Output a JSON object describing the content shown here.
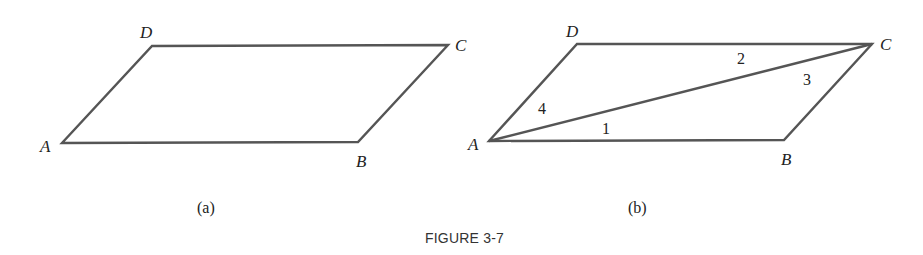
{
  "figure": {
    "caption": "FIGURE 3-7",
    "line_color": "#555555",
    "text_color": "#222222"
  },
  "panel_a": {
    "sublabel": "(a)",
    "vertices": {
      "A": {
        "label": "A",
        "x": 62,
        "y": 143
      },
      "B": {
        "label": "B",
        "x": 358,
        "y": 142
      },
      "C": {
        "label": "C",
        "x": 448,
        "y": 45
      },
      "D": {
        "label": "D",
        "x": 152,
        "y": 46
      }
    },
    "edges": [
      "AB",
      "BC",
      "CD",
      "DA"
    ]
  },
  "panel_b": {
    "sublabel": "(b)",
    "vertices": {
      "A": {
        "label": "A",
        "x": 489,
        "y": 141
      },
      "B": {
        "label": "B",
        "x": 784,
        "y": 140
      },
      "C": {
        "label": "C",
        "x": 872,
        "y": 44
      },
      "D": {
        "label": "D",
        "x": 577,
        "y": 44
      }
    },
    "edges": [
      "AB",
      "BC",
      "CD",
      "DA",
      "AC"
    ],
    "diagonal": "AC",
    "angles": [
      {
        "label": "1",
        "x": 602,
        "y": 134
      },
      {
        "label": "2",
        "x": 741,
        "y": 64
      },
      {
        "label": "3",
        "x": 807,
        "y": 85
      },
      {
        "label": "4",
        "x": 540,
        "y": 114
      }
    ]
  }
}
